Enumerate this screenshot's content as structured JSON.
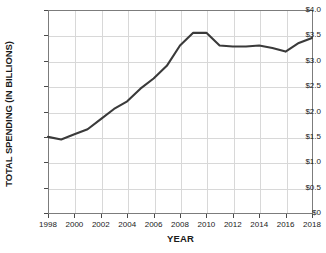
{
  "chart_data": {
    "type": "line",
    "title": "",
    "xlabel": "YEAR",
    "ylabel": "TOTAL SPENDING (IN BILLIONS)",
    "xlim": [
      1998,
      2018
    ],
    "ylim": [
      0,
      4.0
    ],
    "grid": true,
    "legend": "none",
    "line_color": "#3a3a3a",
    "x": [
      1998,
      1999,
      2000,
      2001,
      2002,
      2003,
      2004,
      2005,
      2006,
      2007,
      2008,
      2009,
      2010,
      2011,
      2012,
      2013,
      2014,
      2015,
      2016,
      2017,
      2018
    ],
    "values": [
      1.5,
      1.45,
      1.55,
      1.65,
      1.85,
      2.05,
      2.2,
      2.45,
      2.65,
      2.9,
      3.3,
      3.55,
      3.55,
      3.3,
      3.28,
      3.28,
      3.3,
      3.25,
      3.18,
      3.35,
      3.45
    ],
    "series": [
      {
        "name": "Total Spending",
        "values": [
          1.5,
          1.45,
          1.55,
          1.65,
          1.85,
          2.05,
          2.2,
          2.45,
          2.65,
          2.9,
          3.3,
          3.55,
          3.55,
          3.3,
          3.28,
          3.28,
          3.3,
          3.25,
          3.18,
          3.35,
          3.45
        ]
      }
    ],
    "ytick_labels": [
      "$4.0",
      "$3.5",
      "$3.0",
      "$2.5",
      "$2.0",
      "$1.5",
      "$1.0",
      "$0.5",
      "$0"
    ],
    "ytick_values": [
      4.0,
      3.5,
      3.0,
      2.5,
      2.0,
      1.5,
      1.0,
      0.5,
      0
    ],
    "xtick_labels": [
      "1998",
      "2000",
      "2002",
      "2004",
      "2006",
      "2008",
      "2010",
      "2012",
      "2014",
      "2016",
      "2018"
    ],
    "xtick_values": [
      1998,
      2000,
      2002,
      2004,
      2006,
      2008,
      2010,
      2012,
      2014,
      2016,
      2018
    ]
  }
}
